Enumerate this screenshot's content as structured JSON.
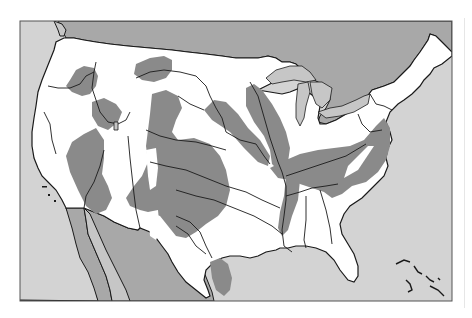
{
  "map": {
    "type": "thematic-map",
    "region": "contiguous-united-states",
    "text_labels": [],
    "frame": {
      "x": 20,
      "y": 21,
      "width": 432,
      "height": 280
    },
    "colors": {
      "page_background": "#ffffff",
      "ocean": "#d3d3d3",
      "foreign_land": "#a8a8a8",
      "great_lakes": "#c6c6c6",
      "us_land": "#ffffff",
      "highlighted_region": "#8a8a8a",
      "borders_and_rivers": "#1a1a1a",
      "frame_border": "#555555"
    },
    "layers": [
      {
        "name": "ocean",
        "fill": "#d3d3d3"
      },
      {
        "name": "canada",
        "fill": "#a8a8a8"
      },
      {
        "name": "mexico",
        "fill": "#a8a8a8"
      },
      {
        "name": "united-states",
        "fill": "#ffffff"
      },
      {
        "name": "shaded-regions",
        "fill": "#8a8a8a"
      },
      {
        "name": "great-lakes",
        "fill": "#c6c6c6"
      },
      {
        "name": "rivers",
        "stroke": "#1a1a1a"
      },
      {
        "name": "caribbean-islands",
        "stroke": "#1a1a1a"
      }
    ],
    "shaded_regions": [
      "pacific-northwest-east-washington",
      "northern-montana",
      "snake-river-plain-idaho",
      "nevada-california-great-basin",
      "colorado-wyoming-high-plains",
      "texas-oklahoma-southern-plains",
      "upper-mississippi-minnesota",
      "missouri-river-dakota",
      "ohio-valley-appalachians",
      "lower-mississippi-valley",
      "southern-texas-rio-grande"
    ]
  }
}
